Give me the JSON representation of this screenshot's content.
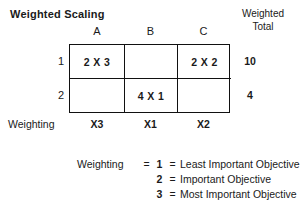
{
  "title": "Weighted Scaling",
  "header": {
    "weighted_total_line1": "Weighted",
    "weighted_total_line2": "Total"
  },
  "columns": [
    {
      "label": "A",
      "weighting": "X3"
    },
    {
      "label": "B",
      "weighting": "X1"
    },
    {
      "label": "C",
      "weighting": "X2"
    }
  ],
  "row_labels": [
    "1",
    "2"
  ],
  "cells": [
    [
      "2 X 3",
      "",
      "2 X 2"
    ],
    [
      "",
      "4 X 1",
      ""
    ]
  ],
  "totals": [
    "10",
    "4"
  ],
  "weighting_label": "Weighting",
  "legend": {
    "prefix": "Weighting",
    "equals": "=",
    "rows": [
      {
        "number": "1",
        "equals": "=",
        "text": "Least Important Objective"
      },
      {
        "number": "2",
        "equals": "=",
        "text": "Important Objective"
      },
      {
        "number": "3",
        "equals": "=",
        "text": "Most Important Objective"
      }
    ]
  },
  "colors": {
    "ink": "#1a1a1a",
    "rule": "#111111",
    "background": "#ffffff"
  }
}
